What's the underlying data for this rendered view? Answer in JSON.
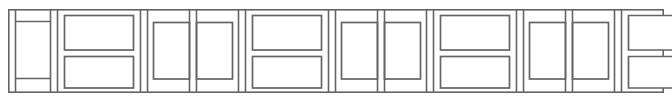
{
  "figure": {
    "width": 672,
    "height": 104,
    "background_color": "#ffffff",
    "line_color": "#646464",
    "line_width": 1.7,
    "motif_count": 9
  },
  "frame": {
    "name": "outer-frame",
    "x": 8,
    "y": 9,
    "width": 656,
    "height": 84,
    "stroke": "#6a6a6a"
  },
  "geometry": {
    "inner_top": 14,
    "inner_bottom": 88,
    "band_top_y": 21,
    "band_bottom_y": 79,
    "mid_gap_top": 50,
    "mid_gap_bottom": 56,
    "column_edges": [
      8,
      50,
      57,
      140,
      147,
      189,
      196,
      238,
      245,
      328,
      335,
      377,
      384,
      426,
      433,
      516,
      523,
      565,
      572,
      614,
      621,
      664
    ],
    "vertical_dividers": [
      50,
      57,
      140,
      147,
      189,
      196,
      238,
      245,
      328,
      335,
      377,
      384,
      426,
      433,
      516,
      523,
      565,
      572,
      614,
      621
    ]
  },
  "motifs": [
    {
      "index": 0,
      "type": "h-motif-truncated-left",
      "label": "Partial H motif clipped by left edge",
      "x": 8,
      "width": 42,
      "rects": [
        {
          "x": 14,
          "y": 15,
          "w": 36,
          "h": 7,
          "name": "upper-bar"
        },
        {
          "x": 14,
          "y": 78,
          "w": 36,
          "h": 10,
          "name": "lower-bar"
        }
      ]
    },
    {
      "index": 1,
      "type": "h-motif",
      "label": "H motif: stacked upper and lower horizontal bars",
      "x": 57,
      "width": 83,
      "rects": [
        {
          "x": 64,
          "y": 15,
          "w": 69,
          "h": 35,
          "name": "upper-bar"
        },
        {
          "x": 64,
          "y": 56,
          "w": 69,
          "h": 32,
          "name": "lower-bar"
        }
      ]
    },
    {
      "index": 2,
      "type": "pillar-motif",
      "label": "Double pillar motif: two tall vertical rectangles",
      "x": 147,
      "width": 91,
      "rects": [
        {
          "x": 153,
          "y": 22,
          "w": 36,
          "h": 57,
          "name": "left-pillar"
        },
        {
          "x": 196,
          "y": 22,
          "w": 36,
          "h": 57,
          "name": "right-pillar"
        }
      ]
    },
    {
      "index": 3,
      "type": "h-motif",
      "label": "H motif: stacked upper and lower horizontal bars",
      "x": 245,
      "width": 83,
      "rects": [
        {
          "x": 252,
          "y": 15,
          "w": 69,
          "h": 35,
          "name": "upper-bar"
        },
        {
          "x": 252,
          "y": 56,
          "w": 69,
          "h": 32,
          "name": "lower-bar"
        }
      ]
    },
    {
      "index": 4,
      "type": "pillar-motif",
      "label": "Double pillar motif: two tall vertical rectangles",
      "x": 335,
      "width": 91,
      "rects": [
        {
          "x": 341,
          "y": 22,
          "w": 36,
          "h": 57,
          "name": "left-pillar"
        },
        {
          "x": 384,
          "y": 22,
          "w": 36,
          "h": 57,
          "name": "right-pillar"
        }
      ]
    },
    {
      "index": 5,
      "type": "h-motif",
      "label": "H motif: stacked upper and lower horizontal bars",
      "x": 433,
      "width": 83,
      "rects": [
        {
          "x": 440,
          "y": 15,
          "w": 69,
          "h": 35,
          "name": "upper-bar"
        },
        {
          "x": 440,
          "y": 56,
          "w": 69,
          "h": 32,
          "name": "lower-bar"
        }
      ]
    },
    {
      "index": 6,
      "type": "pillar-motif",
      "label": "Double pillar motif: two tall vertical rectangles",
      "x": 523,
      "width": 91,
      "rects": [
        {
          "x": 529,
          "y": 22,
          "w": 36,
          "h": 57,
          "name": "left-pillar"
        },
        {
          "x": 572,
          "y": 22,
          "w": 36,
          "h": 57,
          "name": "right-pillar"
        }
      ]
    },
    {
      "index": 7,
      "type": "h-motif-truncated-right",
      "label": "Partial H motif clipped by right edge",
      "x": 621,
      "width": 51,
      "rects": [
        {
          "x": 628,
          "y": 15,
          "w": 44,
          "h": 35,
          "name": "upper-bar"
        },
        {
          "x": 628,
          "y": 56,
          "w": 44,
          "h": 32,
          "name": "lower-bar"
        }
      ]
    }
  ]
}
